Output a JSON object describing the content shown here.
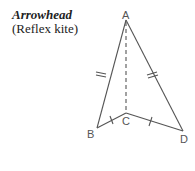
{
  "title": "Arrowhead",
  "subtitle": "(Reflex kite)",
  "vertices": {
    "A": {
      "label": "A",
      "x": 126,
      "y": 20
    },
    "B": {
      "label": "B",
      "x": 97,
      "y": 128
    },
    "C": {
      "label": "C",
      "x": 126,
      "y": 113
    },
    "D": {
      "label": "D",
      "x": 183,
      "y": 131
    }
  },
  "edges": [
    "AB",
    "AD",
    "BC",
    "CD"
  ],
  "dashed": [
    "AC"
  ],
  "equal_marks": {
    "AB_AD": "double-tick",
    "BC_CD": "single-tick"
  },
  "colors": {
    "line": "#555555",
    "text": "#222222"
  }
}
